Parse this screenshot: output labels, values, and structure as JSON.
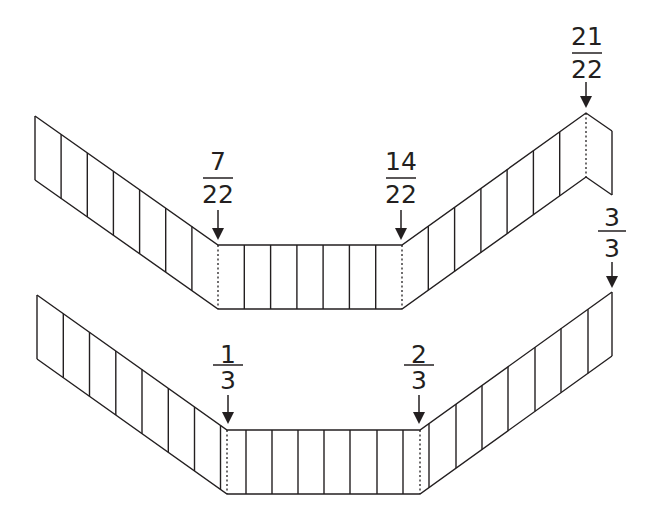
{
  "diagram": {
    "top_strip": {
      "total_cells": 22,
      "labels": [
        {
          "numerator": "7",
          "denominator": "22"
        },
        {
          "numerator": "14",
          "denominator": "22"
        },
        {
          "numerator": "21",
          "denominator": "22"
        }
      ]
    },
    "bottom_strip": {
      "total_parts": 3,
      "labels": [
        {
          "numerator": "1",
          "denominator": "3"
        },
        {
          "numerator": "2",
          "denominator": "3"
        },
        {
          "numerator": "3",
          "denominator": "3"
        }
      ]
    },
    "colors": {
      "line": "#231f20",
      "background": "#ffffff"
    }
  }
}
